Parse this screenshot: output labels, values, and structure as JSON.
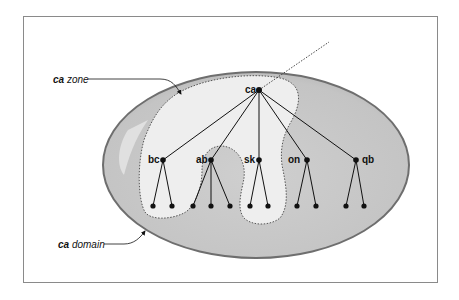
{
  "diagram": {
    "type": "dns-zone-vs-domain",
    "callouts": {
      "zone": {
        "bold": "ca",
        "rest": " zone"
      },
      "domain": {
        "bold": "ca",
        "rest": " domain"
      }
    },
    "root": {
      "label": "ca"
    },
    "children": [
      {
        "label": "bc",
        "leaves": 2
      },
      {
        "label": "ab",
        "leaves": 3
      },
      {
        "label": "sk",
        "leaves": 2
      },
      {
        "label": "on",
        "leaves": 2
      },
      {
        "label": "qb",
        "leaves": 2
      }
    ],
    "colors": {
      "domain_fill": "#c8c8c8",
      "domain_stroke": "#6e6e6e",
      "zone_fill": "#eeeeee",
      "line": "#111111",
      "frame": "#8a8a8a"
    }
  }
}
